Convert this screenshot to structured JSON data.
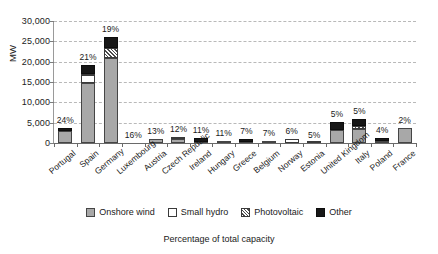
{
  "chart_data": {
    "type": "bar",
    "stacked": true,
    "title": "",
    "subtitle": "",
    "xlabel": "",
    "ylabel": "MW",
    "caption": "Percentage of total capacity",
    "ylim": [
      0,
      30000
    ],
    "ytick_labels": [
      "30,000",
      "25,000",
      "20,000",
      "15,000",
      "10,000",
      "5,000",
      "0"
    ],
    "ytick_values": [
      30000,
      25000,
      20000,
      15000,
      10000,
      5000,
      0
    ],
    "grid": true,
    "legend_position": "bottom",
    "categories": [
      "Portugal",
      "Spain",
      "Germany",
      "Luxembourg",
      "Austria",
      "Czech Republic",
      "Ireland",
      "Hungary",
      "Greece",
      "Belgium",
      "Norway",
      "Estonia",
      "United Kingdom",
      "Italy",
      "Poland",
      "France"
    ],
    "data_labels": [
      "24%",
      "21%",
      "19%",
      "16%",
      "13%",
      "12%",
      "11%",
      "11%",
      "7%",
      "7%",
      "6%",
      "5%",
      "5%",
      "5%",
      "4%",
      "2%"
    ],
    "series": [
      {
        "name": "Onshore wind",
        "color": "#a8a8a8",
        "values": [
          2900,
          14800,
          21000,
          0,
          900,
          900,
          150,
          450,
          200,
          600,
          0,
          0,
          3200,
          3400,
          400,
          3600
        ]
      },
      {
        "name": "Small hydro",
        "color": "#ffffff",
        "values": [
          0,
          1900,
          0,
          0,
          0,
          700,
          0,
          0,
          0,
          0,
          1100,
          120,
          0,
          0,
          0,
          0
        ]
      },
      {
        "name": "Photovoltaic",
        "color": "hatched",
        "values": [
          0,
          300,
          2300,
          0,
          0,
          0,
          0,
          0,
          0,
          0,
          0,
          0,
          0,
          700,
          0,
          0
        ]
      },
      {
        "name": "Other",
        "color": "#171717",
        "values": [
          800,
          2100,
          2700,
          0,
          0,
          0,
          1100,
          0,
          800,
          0,
          0,
          0,
          1900,
          1700,
          900,
          0
        ]
      }
    ],
    "totals": [
      3700,
      19100,
      26000,
      0,
      900,
      1600,
      1250,
      450,
      1000,
      600,
      1100,
      120,
      5100,
      5800,
      1300,
      3600
    ]
  },
  "legend": {
    "items": [
      {
        "label": "Onshore wind",
        "swatch": "wind"
      },
      {
        "label": "Small hydro",
        "swatch": "hydro"
      },
      {
        "label": "Photovoltaic",
        "swatch": "pv"
      },
      {
        "label": "Other",
        "swatch": "other"
      }
    ]
  }
}
